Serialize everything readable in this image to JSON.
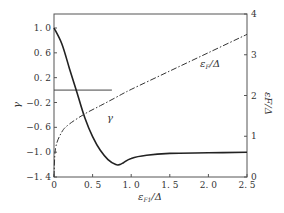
{
  "chart_data": {
    "type": "line",
    "title": "",
    "xlabel": "εF1/Δ",
    "ylabel": "γ",
    "y2label": "εF/Δ",
    "xlim": [
      0,
      2.5
    ],
    "ylim": [
      -1.4,
      1.2
    ],
    "y2lim": [
      0,
      4
    ],
    "x_ticks": [
      "0",
      "0.5",
      "1.0",
      "1.5",
      "2.0",
      "2.5"
    ],
    "y_ticks": [
      "1.0",
      "0.6",
      "0.2",
      "-0.2",
      "-0.6",
      "-1.0",
      "-1.4"
    ],
    "y2_ticks": [
      "4",
      "3",
      "2",
      "1",
      "0"
    ],
    "grid": false,
    "series": [
      {
        "name": "γ",
        "axis": "left",
        "style": "solid",
        "x": [
          0,
          0.1,
          0.2,
          0.3,
          0.4,
          0.5,
          0.6,
          0.7,
          0.8,
          0.85,
          0.9,
          1.0,
          1.2,
          1.5,
          2.0,
          2.5
        ],
        "y": [
          1.0,
          0.75,
          0.35,
          -0.05,
          -0.45,
          -0.75,
          -0.97,
          -1.12,
          -1.2,
          -1.2,
          -1.17,
          -1.1,
          -1.05,
          -1.02,
          -1.01,
          -1.0
        ]
      },
      {
        "name": "εF/Δ",
        "axis": "right",
        "style": "dash-dot",
        "x": [
          0,
          0.02,
          0.1,
          0.2,
          0.4,
          0.6,
          0.8,
          1.0,
          1.5,
          2.0,
          2.5
        ],
        "y": [
          0,
          0.7,
          1.1,
          1.3,
          1.55,
          1.75,
          1.95,
          2.15,
          2.6,
          3.05,
          3.5
        ]
      }
    ],
    "annotations": [
      {
        "text": "γ",
        "x": 0.63,
        "y": -0.82
      },
      {
        "text": "εF/Δ",
        "x": 1.6,
        "y2": 2.9
      },
      {
        "text": "horizontal reference line",
        "y": 0,
        "x_range": [
          0,
          0.75
        ]
      }
    ]
  },
  "labels": {
    "xlabel_main": "ε",
    "xlabel_sub": "F1",
    "xlabel_tail": "/Δ",
    "ylabel": "γ",
    "y2label": "εF/Δ",
    "curve_gamma": "γ",
    "curve_ef_main": "ε",
    "curve_ef_sub": "F",
    "curve_ef_tail": "/Δ"
  }
}
